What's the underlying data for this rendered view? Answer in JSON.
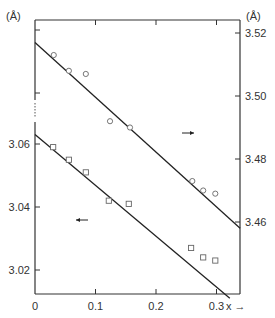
{
  "chart_data": {
    "type": "scatter",
    "title": "",
    "xlabel": "x →",
    "ylabel_left": "(Å)",
    "ylabel_right": "(Å)",
    "xlim": [
      0,
      0.335
    ],
    "ylim_left": [
      3.01,
      3.077
    ],
    "ylim_right": [
      3.455,
      3.523
    ],
    "x_ticks": [
      0,
      0.1,
      0.2,
      0.3
    ],
    "x_tick_labels": [
      "0",
      "0.1",
      "0.2",
      "0.3"
    ],
    "y_left_ticks": [
      3.02,
      3.04,
      3.06
    ],
    "y_left_tick_labels": [
      "3.02",
      "3.04",
      "3.06"
    ],
    "y_right_ticks": [
      3.46,
      3.48,
      3.5,
      3.52
    ],
    "y_right_tick_labels": [
      "3.46",
      "3.48",
      "3.50",
      "3.52"
    ],
    "grid": false,
    "left_axis_break": true,
    "series": [
      {
        "name": "circles (right axis)",
        "marker": "circle",
        "axis": "right",
        "x": [
          0.031,
          0.056,
          0.084,
          0.124,
          0.157,
          0.26,
          0.278,
          0.298
        ],
        "y": [
          3.513,
          3.508,
          3.507,
          3.492,
          3.49,
          3.473,
          3.47,
          3.469
        ],
        "fit_line": {
          "x": [
            0,
            0.339
          ],
          "y": [
            3.517,
            3.458
          ]
        },
        "annotation": "→ (right axis)"
      },
      {
        "name": "squares (left axis)",
        "marker": "square",
        "axis": "left",
        "x": [
          0.03,
          0.056,
          0.084,
          0.122,
          0.155,
          0.258,
          0.278,
          0.298
        ],
        "y": [
          3.059,
          3.055,
          3.051,
          3.042,
          3.041,
          3.027,
          3.024,
          3.023
        ],
        "fit_line": {
          "x": [
            0,
            0.322
          ],
          "y": [
            3.063,
            3.011
          ]
        },
        "annotation": "← (left axis)"
      }
    ]
  },
  "labels": {
    "unit_left": "(Å)",
    "unit_right": "(Å)",
    "x_axis": "x →",
    "arrow_right": "→",
    "arrow_left": "←"
  }
}
